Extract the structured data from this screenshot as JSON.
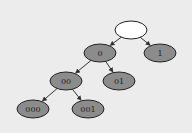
{
  "diagram": {
    "type": "binary-tree",
    "colors": {
      "background": "#ececec",
      "root_fill": "#ffffff",
      "node_fill": "#8c8c8c",
      "stroke": "#222222",
      "edge": "#333333"
    },
    "nodes": [
      {
        "id": "root",
        "label": "",
        "x": 131,
        "y": 30,
        "fill": "#ffffff"
      },
      {
        "id": "n0",
        "label": "0",
        "x": 100,
        "y": 53
      },
      {
        "id": "n1",
        "label": "1",
        "x": 160,
        "y": 53
      },
      {
        "id": "n00",
        "label": "00",
        "x": 66,
        "y": 81
      },
      {
        "id": "n01",
        "label": "01",
        "x": 119,
        "y": 81
      },
      {
        "id": "n000",
        "label": "000",
        "x": 33,
        "y": 109
      },
      {
        "id": "n001",
        "label": "001",
        "x": 88,
        "y": 109
      }
    ],
    "edges": [
      {
        "from": "root",
        "to": "n0"
      },
      {
        "from": "root",
        "to": "n1"
      },
      {
        "from": "n0",
        "to": "n00"
      },
      {
        "from": "n0",
        "to": "n01"
      },
      {
        "from": "n00",
        "to": "n000"
      },
      {
        "from": "n00",
        "to": "n001"
      }
    ]
  }
}
